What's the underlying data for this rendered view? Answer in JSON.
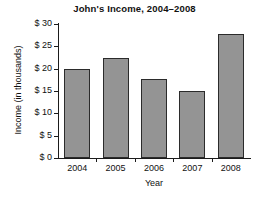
{
  "chart_data": {
    "type": "bar",
    "title": "John's Income, 2004–2008",
    "xlabel": "Year",
    "ylabel": "Income (in thousands)",
    "categories": [
      "2004",
      "2005",
      "2006",
      "2007",
      "2008"
    ],
    "values": [
      20,
      22.5,
      17.8,
      15,
      27.8
    ],
    "ylim": [
      0,
      30
    ],
    "ytick_values": [
      0,
      5,
      10,
      15,
      20,
      25,
      30
    ],
    "ytick_labels": [
      "$ 0",
      "$ 5",
      "$ 10",
      "$ 15",
      "$ 20",
      "$ 25",
      "$ 30"
    ],
    "grid": false,
    "legend": false,
    "bar_color": "#949494",
    "bar_border_color": "#2b2b2b",
    "axis_color": "#1b1b1b",
    "background_color": "#ffffff"
  }
}
